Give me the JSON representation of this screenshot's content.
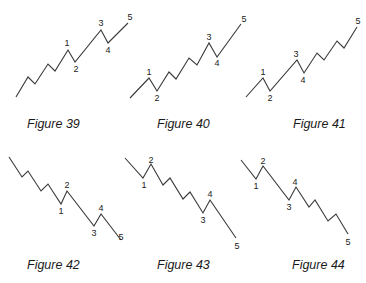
{
  "figures": [
    {
      "caption": "Figure 39",
      "caption_pos": [
        27,
        117
      ],
      "direction": "up",
      "extended_wave": "1",
      "points": [
        [
          16,
          97
        ],
        [
          28,
          77
        ],
        [
          35,
          84
        ],
        [
          48,
          64
        ],
        [
          55,
          71
        ],
        [
          68,
          50
        ],
        [
          75,
          62
        ],
        [
          101,
          30
        ],
        [
          108,
          43
        ],
        [
          128,
          23
        ]
      ],
      "labels": [
        {
          "text": "1",
          "x": 67,
          "y": 46
        },
        {
          "text": "2",
          "x": 76,
          "y": 72
        },
        {
          "text": "3",
          "x": 101,
          "y": 26
        },
        {
          "text": "4",
          "x": 108,
          "y": 53
        },
        {
          "text": "5",
          "x": 130,
          "y": 20
        }
      ]
    },
    {
      "caption": "Figure 40",
      "caption_pos": [
        157,
        117
      ],
      "direction": "up",
      "extended_wave": "3",
      "points": [
        [
          130,
          98
        ],
        [
          149,
          78
        ],
        [
          157,
          91
        ],
        [
          169,
          72
        ],
        [
          176,
          79
        ],
        [
          189,
          58
        ],
        [
          197,
          65
        ],
        [
          209,
          43
        ],
        [
          217,
          57
        ],
        [
          241,
          24
        ]
      ],
      "labels": [
        {
          "text": "1",
          "x": 149,
          "y": 75
        },
        {
          "text": "2",
          "x": 157,
          "y": 101
        },
        {
          "text": "3",
          "x": 209,
          "y": 40
        },
        {
          "text": "4",
          "x": 217,
          "y": 66
        },
        {
          "text": "5",
          "x": 244,
          "y": 22
        }
      ]
    },
    {
      "caption": "Figure 41",
      "caption_pos": [
        293,
        117
      ],
      "direction": "up",
      "extended_wave": "5",
      "points": [
        [
          246,
          97
        ],
        [
          263,
          78
        ],
        [
          270,
          91
        ],
        [
          297,
          60
        ],
        [
          304,
          73
        ],
        [
          317,
          53
        ],
        [
          324,
          60
        ],
        [
          337,
          41
        ],
        [
          344,
          48
        ],
        [
          357,
          27
        ]
      ],
      "labels": [
        {
          "text": "1",
          "x": 263,
          "y": 75
        },
        {
          "text": "2",
          "x": 270,
          "y": 101
        },
        {
          "text": "3",
          "x": 296,
          "y": 57
        },
        {
          "text": "4",
          "x": 303,
          "y": 83
        },
        {
          "text": "5",
          "x": 358,
          "y": 24
        }
      ]
    },
    {
      "caption": "Figure 42",
      "caption_pos": [
        27,
        258
      ],
      "direction": "down",
      "extended_wave": "1",
      "points": [
        [
          9,
          157
        ],
        [
          22,
          177
        ],
        [
          28,
          171
        ],
        [
          41,
          191
        ],
        [
          48,
          184
        ],
        [
          61,
          204
        ],
        [
          67,
          191
        ],
        [
          94,
          226
        ],
        [
          101,
          214
        ],
        [
          121,
          240
        ]
      ],
      "labels": [
        {
          "text": "1",
          "x": 61,
          "y": 214
        },
        {
          "text": "2",
          "x": 67,
          "y": 188
        },
        {
          "text": "3",
          "x": 94,
          "y": 236
        },
        {
          "text": "4",
          "x": 101,
          "y": 211
        },
        {
          "text": "5",
          "x": 121,
          "y": 240
        }
      ]
    },
    {
      "caption": "Figure 43",
      "caption_pos": [
        157,
        258
      ],
      "direction": "down",
      "extended_wave": "3",
      "points": [
        [
          125,
          158
        ],
        [
          143,
          178
        ],
        [
          151,
          164
        ],
        [
          163,
          185
        ],
        [
          170,
          178
        ],
        [
          183,
          199
        ],
        [
          190,
          192
        ],
        [
          203,
          213
        ],
        [
          210,
          200
        ],
        [
          236,
          238
        ]
      ],
      "labels": [
        {
          "text": "1",
          "x": 144,
          "y": 188
        },
        {
          "text": "2",
          "x": 151,
          "y": 163
        },
        {
          "text": "3",
          "x": 203,
          "y": 223
        },
        {
          "text": "4",
          "x": 210,
          "y": 197
        },
        {
          "text": "5",
          "x": 237,
          "y": 249
        }
      ]
    },
    {
      "caption": "Figure 44",
      "caption_pos": [
        292,
        258
      ],
      "direction": "down",
      "extended_wave": "5",
      "points": [
        [
          241,
          160
        ],
        [
          256,
          179
        ],
        [
          263,
          166
        ],
        [
          289,
          200
        ],
        [
          296,
          187
        ],
        [
          309,
          207
        ],
        [
          315,
          200
        ],
        [
          328,
          221
        ],
        [
          336,
          214
        ],
        [
          348,
          234
        ]
      ],
      "labels": [
        {
          "text": "1",
          "x": 256,
          "y": 189
        },
        {
          "text": "2",
          "x": 263,
          "y": 164
        },
        {
          "text": "3",
          "x": 289,
          "y": 210
        },
        {
          "text": "4",
          "x": 295,
          "y": 185
        },
        {
          "text": "5",
          "x": 348,
          "y": 245
        }
      ]
    }
  ],
  "colors": {
    "line": "#3a3a3a",
    "text": "#1a1a1a",
    "background": "#ffffff"
  }
}
